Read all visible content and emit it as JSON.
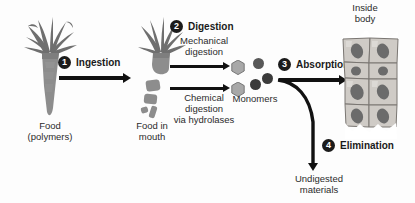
{
  "diagram": {
    "title_region": {
      "inside_body": "Inside\nbody"
    },
    "labels": {
      "food_polymers_line1": "Food",
      "food_polymers_line2": "(polymers)",
      "food_in_mouth_line1": "Food in",
      "food_in_mouth_line2": "mouth",
      "monomers": "Monomers",
      "inside_body_line1": "Inside",
      "inside_body_line2": "body",
      "undigested_line1": "Undigested",
      "undigested_line2": "materials"
    },
    "steps": [
      {
        "number": "1",
        "title": "Ingestion"
      },
      {
        "number": "2",
        "title": "Digestion"
      },
      {
        "number": "3",
        "title": "Absorption"
      },
      {
        "number": "4",
        "title": "Elimination"
      }
    ],
    "digestion_pathways": [
      {
        "line1": "Mechanical",
        "line2": "digestion",
        "line3": ""
      },
      {
        "line1": "Chemical",
        "line2": "digestion",
        "line3": "via hydrolases"
      }
    ],
    "colors": {
      "ink": "#1b1b1b",
      "carrot_body": "#8d8d8d",
      "carrot_leaf": "#6f6f6f",
      "monomer_hex": "#a8a8a8",
      "monomer_circle": "#4a4a4a",
      "cell_fill": "#cfcbc6",
      "nucleus": "#6b6b6b",
      "background": "#ffffff"
    }
  }
}
